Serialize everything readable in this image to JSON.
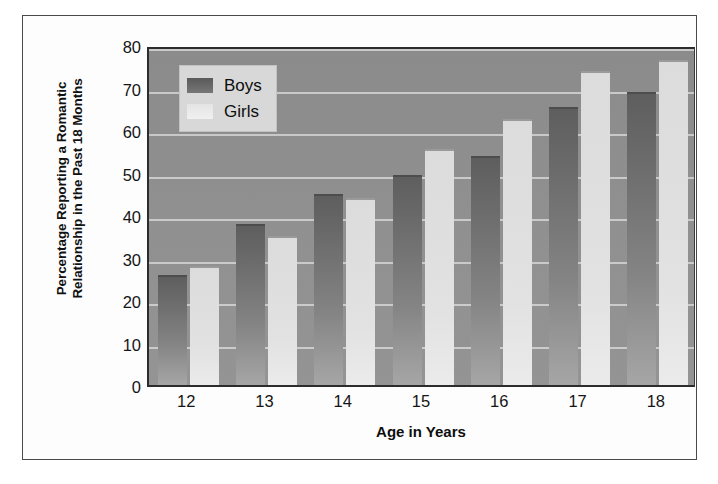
{
  "chart_data": {
    "type": "bar",
    "title": "",
    "xlabel": "Age in Years",
    "ylabel": "Percentage Reporting a Romantic Relationship in the Past 18 Months",
    "categories": [
      "12",
      "13",
      "14",
      "15",
      "16",
      "17",
      "18"
    ],
    "series": [
      {
        "name": "Boys",
        "values": [
          26,
          38,
          45,
          49.5,
          54,
          65.5,
          69
        ],
        "color": "#6b6b6b"
      },
      {
        "name": "Girls",
        "values": [
          28,
          35,
          44,
          55.5,
          62.5,
          74,
          76.5
        ],
        "color": "#e2e2e2"
      }
    ],
    "ylim": [
      0,
      80
    ],
    "yticks": [
      0,
      10,
      20,
      30,
      40,
      50,
      60,
      70,
      80
    ],
    "ytick_labels": [
      "0",
      "10",
      "20",
      "30",
      "40",
      "50",
      "60",
      "70",
      "80"
    ],
    "grid": true,
    "grid_axis": "y",
    "legend_position": "top-left",
    "legend_entries": [
      "Boys",
      "Girls"
    ],
    "plot_background": "#8f8f8f",
    "figure_background": "#fdfdfd"
  },
  "axis": {
    "y_title_line1": "Percentage Reporting a Romantic",
    "y_title_line2": "Relationship in the Past 18 Months",
    "x_title": "Age in Years"
  },
  "legend": {
    "boys_label": "Boys",
    "girls_label": "Girls"
  }
}
